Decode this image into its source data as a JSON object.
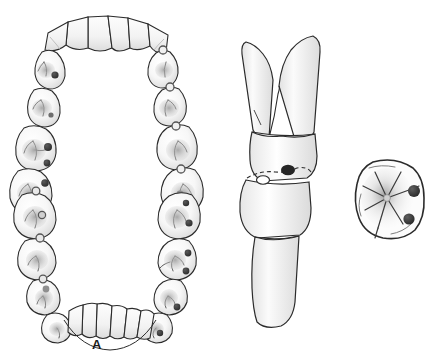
{
  "figure": {
    "background_color": "#ffffff",
    "width": 435,
    "height": 357,
    "panel_count": 3
  },
  "colors": {
    "outline": "#2b2b2b",
    "enamel_fill": "#fbfbfb",
    "enamel_shade": "#d8d8d8",
    "enamel_shade_light": "#ececec",
    "caries_dark": "#3a3a3a",
    "caries_mid": "#6b6b6b",
    "fissure_line": "#4a4a4a",
    "contact_ring": "#555555",
    "label_color": "#1a1a1a"
  },
  "panels": [
    {
      "id": "a",
      "label": "A",
      "caption": "Maxillary and mandibular dental arches, occlusal view",
      "arches": [
        {
          "name": "maxillary-arch",
          "position": "upper",
          "anterior_teeth": 6,
          "posterior_teeth_left": 4,
          "posterior_teeth_right": 4,
          "caries_side": "left",
          "contact_points_side": "right"
        },
        {
          "name": "mandibular-arch",
          "position": "lower",
          "anterior_teeth": 6,
          "posterior_teeth_left": 4,
          "posterior_teeth_right": 4,
          "caries_side": "both",
          "contact_points_side": "left"
        }
      ]
    },
    {
      "id": "b",
      "label": "B",
      "caption": "Opposing posterior teeth in proximal contact with interproximal carious lesion",
      "teeth": [
        {
          "name": "maxillary-molar",
          "roots": 2,
          "position": "upper"
        },
        {
          "name": "mandibular-molar",
          "roots": 1,
          "position": "lower"
        }
      ],
      "lesion": {
        "name": "interproximal-caries",
        "shape": "dark-oval"
      },
      "dashed_outline": true
    },
    {
      "id": "c",
      "label": "C",
      "caption": "Single molar, occlusal view with pit and fissure caries",
      "lesions": 2,
      "fissure_pattern": "central-groove-radiating"
    }
  ]
}
